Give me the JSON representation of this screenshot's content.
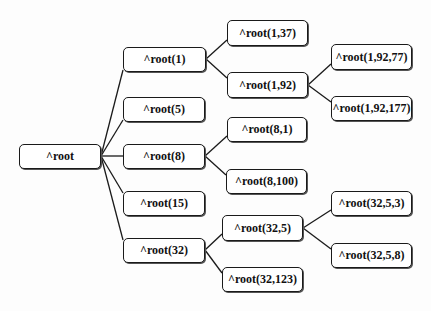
{
  "diagram": {
    "type": "tree",
    "orientation": "left-to-right",
    "nodes": [
      {
        "id": "root",
        "label": "^root",
        "x": 19,
        "y": 144,
        "w": 82,
        "h": 25
      },
      {
        "id": "n1",
        "label": "^root(1)",
        "x": 123,
        "y": 47,
        "w": 83,
        "h": 25
      },
      {
        "id": "n5",
        "label": "^root(5)",
        "x": 123,
        "y": 97,
        "w": 82,
        "h": 25
      },
      {
        "id": "n8",
        "label": "^root(8)",
        "x": 123,
        "y": 144,
        "w": 82,
        "h": 25
      },
      {
        "id": "n15",
        "label": "^root(15)",
        "x": 123,
        "y": 191,
        "w": 82,
        "h": 25
      },
      {
        "id": "n32",
        "label": "^root(32)",
        "x": 123,
        "y": 238,
        "w": 82,
        "h": 25
      },
      {
        "id": "n1_37",
        "label": "^root(1,37)",
        "x": 227,
        "y": 20,
        "w": 81,
        "h": 26
      },
      {
        "id": "n1_92",
        "label": "^root(1,92)",
        "x": 227,
        "y": 72,
        "w": 81,
        "h": 26
      },
      {
        "id": "n8_1",
        "label": "^root(8,1)",
        "x": 227,
        "y": 117,
        "w": 80,
        "h": 25
      },
      {
        "id": "n8_100",
        "label": "^root(8,100)",
        "x": 226,
        "y": 169,
        "w": 81,
        "h": 25
      },
      {
        "id": "n32_5",
        "label": "^root(32,5)",
        "x": 222,
        "y": 215,
        "w": 81,
        "h": 26
      },
      {
        "id": "n32_123",
        "label": "^root(32,123)",
        "x": 222,
        "y": 267,
        "w": 81,
        "h": 25
      },
      {
        "id": "n1_92_77",
        "label": "^root(1,92,77)",
        "x": 331,
        "y": 44,
        "w": 81,
        "h": 26
      },
      {
        "id": "n1_92_177",
        "label": "^root(1,92,177)",
        "x": 331,
        "y": 96,
        "w": 81,
        "h": 25
      },
      {
        "id": "n32_5_3",
        "label": "^root(32,5,3)",
        "x": 331,
        "y": 191,
        "w": 81,
        "h": 25
      },
      {
        "id": "n32_5_8",
        "label": "^root(32,5,8)",
        "x": 331,
        "y": 243,
        "w": 81,
        "h": 25
      }
    ],
    "edges": [
      {
        "from": "root",
        "to": "n1",
        "x1": 101,
        "y1": 156,
        "x2": 123,
        "y2": 70
      },
      {
        "from": "root",
        "to": "n5",
        "x1": 101,
        "y1": 156,
        "x2": 123,
        "y2": 120
      },
      {
        "from": "root",
        "to": "n8",
        "x1": 101,
        "y1": 156,
        "x2": 123,
        "y2": 156
      },
      {
        "from": "root",
        "to": "n15",
        "x1": 101,
        "y1": 156,
        "x2": 123,
        "y2": 193
      },
      {
        "from": "root",
        "to": "n32",
        "x1": 101,
        "y1": 156,
        "x2": 123,
        "y2": 240
      },
      {
        "from": "n1",
        "to": "n1_37",
        "x1": 206,
        "y1": 59,
        "x2": 227,
        "y2": 40
      },
      {
        "from": "n1",
        "to": "n1_92",
        "x1": 206,
        "y1": 59,
        "x2": 227,
        "y2": 78
      },
      {
        "from": "n1_92",
        "to": "n1_92_77",
        "x1": 308,
        "y1": 85,
        "x2": 331,
        "y2": 64
      },
      {
        "from": "n1_92",
        "to": "n1_92_177",
        "x1": 308,
        "y1": 85,
        "x2": 331,
        "y2": 102
      },
      {
        "from": "n8",
        "to": "n8_1",
        "x1": 205,
        "y1": 156,
        "x2": 227,
        "y2": 136
      },
      {
        "from": "n8",
        "to": "n8_100",
        "x1": 205,
        "y1": 156,
        "x2": 226,
        "y2": 175
      },
      {
        "from": "n32",
        "to": "n32_5",
        "x1": 205,
        "y1": 250,
        "x2": 222,
        "y2": 234
      },
      {
        "from": "n32",
        "to": "n32_123",
        "x1": 205,
        "y1": 250,
        "x2": 222,
        "y2": 273
      },
      {
        "from": "n32_5",
        "to": "n32_5_3",
        "x1": 303,
        "y1": 228,
        "x2": 331,
        "y2": 210
      },
      {
        "from": "n32_5",
        "to": "n32_5_8",
        "x1": 303,
        "y1": 228,
        "x2": 331,
        "y2": 249
      }
    ]
  }
}
